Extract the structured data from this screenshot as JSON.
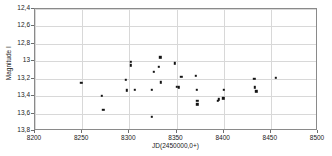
{
  "chart_data": {
    "type": "scatter",
    "title": "",
    "xlabel": "JD(2450000,0+)",
    "ylabel": "Magnitude I",
    "xlim": [
      8200,
      8500
    ],
    "ylim": [
      13.8,
      12.4
    ],
    "y_inverted": true,
    "grid": true,
    "legend": null,
    "xticks": [
      8200,
      8250,
      8300,
      8350,
      8400,
      8450,
      8500
    ],
    "xticklabels": [
      "8200",
      "8250",
      "8300",
      "8350",
      "8400",
      "8450",
      "8500"
    ],
    "yticks": [
      12.4,
      12.6,
      12.8,
      13.0,
      13.2,
      13.4,
      13.6,
      13.8
    ],
    "yticklabels": [
      "12,4",
      "12,6",
      "12,8",
      "13",
      "13,2",
      "13,4",
      "13,6",
      "13,8"
    ],
    "marker": "square",
    "marker_color": "#141414",
    "grid_color": "#d8d8d8",
    "frame_color": "#8a8a8a",
    "points": [
      {
        "x": 8249.0,
        "y": 13.245
      },
      {
        "x": 8271.0,
        "y": 13.395
      },
      {
        "x": 8272.5,
        "y": 13.555
      },
      {
        "x": 8296.5,
        "y": 13.215
      },
      {
        "x": 8297.0,
        "y": 13.335
      },
      {
        "x": 8301.5,
        "y": 13.005
      },
      {
        "x": 8301.5,
        "y": 13.045
      },
      {
        "x": 8305.5,
        "y": 13.33
      },
      {
        "x": 8323.5,
        "y": 13.33
      },
      {
        "x": 8323.5,
        "y": 13.635
      },
      {
        "x": 8326.0,
        "y": 13.12
      },
      {
        "x": 8331.5,
        "y": 13.06
      },
      {
        "x": 8333.0,
        "y": 12.955
      },
      {
        "x": 8333.5,
        "y": 13.24
      },
      {
        "x": 8348.5,
        "y": 13.025
      },
      {
        "x": 8350.0,
        "y": 13.29
      },
      {
        "x": 8352.5,
        "y": 13.3
      },
      {
        "x": 8355.0,
        "y": 13.175
      },
      {
        "x": 8370.5,
        "y": 13.17
      },
      {
        "x": 8371.5,
        "y": 13.325
      },
      {
        "x": 8372.0,
        "y": 13.45
      },
      {
        "x": 8372.0,
        "y": 13.495
      },
      {
        "x": 8393.5,
        "y": 13.45
      },
      {
        "x": 8395.0,
        "y": 13.435
      },
      {
        "x": 8399.5,
        "y": 13.425
      },
      {
        "x": 8400.0,
        "y": 13.325
      },
      {
        "x": 8432.5,
        "y": 13.2
      },
      {
        "x": 8433.0,
        "y": 13.3
      },
      {
        "x": 8434.5,
        "y": 13.345
      },
      {
        "x": 8455.0,
        "y": 13.19
      }
    ]
  }
}
